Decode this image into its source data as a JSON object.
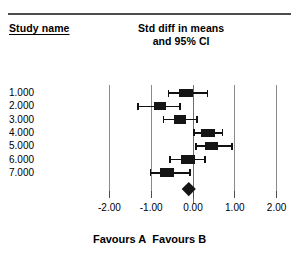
{
  "header": {
    "study_column_label": "Study name",
    "effect_header_line1": "Std diff in means",
    "effect_header_line2": "and 95% CI"
  },
  "footer": {
    "favours_left": "Favours A",
    "favours_right": "Favours B"
  },
  "chart_data": {
    "type": "forest",
    "title": "Std diff in means and 95% CI",
    "xlabel": "",
    "ylabel": "",
    "xlim": [
      -2.0,
      2.0
    ],
    "grid": true,
    "legend": "none",
    "axis_ticks": [
      "-2.00",
      "-1.00",
      "0.00",
      "1.00",
      "2.00"
    ],
    "axis_tick_values": [
      -2.0,
      -1.0,
      0.0,
      1.0,
      2.0
    ],
    "null_line": 0.0,
    "gridline_values": [
      -2.0,
      -1.0,
      1.0,
      2.0
    ],
    "categories": [
      "1.000",
      "2.000",
      "3.000",
      "4.000",
      "5.000",
      "6.000",
      "7.000"
    ],
    "studies": [
      {
        "name": "1.000",
        "effect": -0.17,
        "lower": -0.59,
        "upper": 0.35,
        "weight": 0.92
      },
      {
        "name": "2.000",
        "effect": -0.79,
        "lower": -1.31,
        "upper": -0.31,
        "weight": 0.72
      },
      {
        "name": "3.000",
        "effect": -0.31,
        "lower": -0.71,
        "upper": 0.1,
        "weight": 0.8
      },
      {
        "name": "4.000",
        "effect": 0.36,
        "lower": 0.02,
        "upper": 0.71,
        "weight": 0.86
      },
      {
        "name": "5.000",
        "effect": 0.45,
        "lower": 0.07,
        "upper": 0.93,
        "weight": 0.8
      },
      {
        "name": "6.000",
        "effect": -0.12,
        "lower": -0.55,
        "upper": 0.29,
        "weight": 0.94
      },
      {
        "name": "7.000",
        "effect": -0.62,
        "lower": -1.02,
        "upper": -0.07,
        "weight": 0.88
      }
    ],
    "summary": {
      "name": "Overall",
      "effect": -0.1,
      "lower": -0.26,
      "upper": 0.06
    }
  },
  "colors": {
    "marker": "#151515",
    "gridline": "#8a8a8a",
    "rule": "#4d4d4d",
    "background": "#ffffff"
  }
}
